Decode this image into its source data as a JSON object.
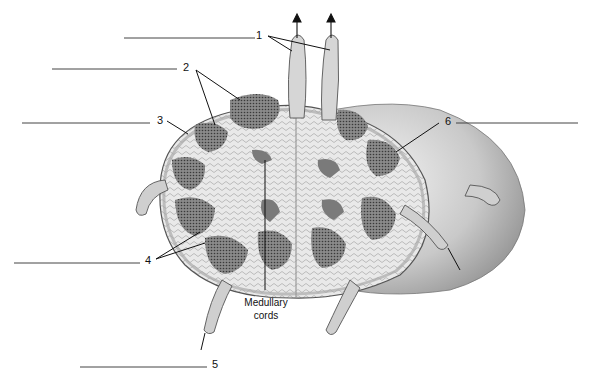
{
  "figure": {
    "labels": [
      {
        "id": "1",
        "text": "1"
      },
      {
        "id": "2",
        "text": "2"
      },
      {
        "id": "3",
        "text": "3"
      },
      {
        "id": "4",
        "text": "4"
      },
      {
        "id": "5",
        "text": "5"
      },
      {
        "id": "6",
        "text": "6"
      }
    ],
    "captions": {
      "medullary_cords_line1": "Medullary",
      "medullary_cords_line2": "cords"
    },
    "colors": {
      "capsule": "#b8b8b8",
      "tissue": "#e6e6e6",
      "follicle": "#7a7a7a",
      "shading": "#9a9a9a",
      "line": "#222222"
    }
  }
}
